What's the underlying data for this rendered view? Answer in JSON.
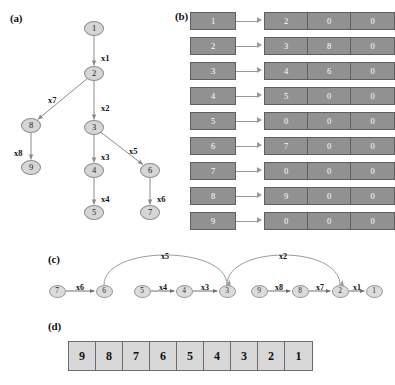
{
  "figure": {
    "panels": [
      {
        "id": "a",
        "label": "(a)"
      },
      {
        "id": "b",
        "label": "(b)"
      },
      {
        "id": "c",
        "label": "(c)"
      },
      {
        "id": "d",
        "label": "(d)"
      }
    ]
  },
  "chart_data": {
    "type": "diagram",
    "title": "",
    "panel_a": {
      "type": "tree",
      "nodes": [
        {
          "id": "1",
          "label": "1",
          "x": 94,
          "y": 28
        },
        {
          "id": "2",
          "label": "2",
          "x": 94,
          "y": 73
        },
        {
          "id": "3",
          "label": "3",
          "x": 94,
          "y": 127
        },
        {
          "id": "4",
          "label": "4",
          "x": 94,
          "y": 170
        },
        {
          "id": "5",
          "label": "5",
          "x": 94,
          "y": 212
        },
        {
          "id": "6",
          "label": "6",
          "x": 150,
          "y": 170
        },
        {
          "id": "7",
          "label": "7",
          "x": 150,
          "y": 212
        },
        {
          "id": "8",
          "label": "8",
          "x": 31,
          "y": 125
        },
        {
          "id": "9",
          "label": "9",
          "x": 31,
          "y": 167
        }
      ],
      "edges": [
        {
          "from": "1",
          "to": "2",
          "label": "x1",
          "lx": 101,
          "ly": 53
        },
        {
          "from": "2",
          "to": "3",
          "label": "x2",
          "lx": 101,
          "ly": 103
        },
        {
          "from": "2",
          "to": "8",
          "label": "x7",
          "lx": 48,
          "ly": 95
        },
        {
          "from": "3",
          "to": "4",
          "label": "x3",
          "lx": 101,
          "ly": 152
        },
        {
          "from": "3",
          "to": "6",
          "label": "x5",
          "lx": 129,
          "ly": 146
        },
        {
          "from": "4",
          "to": "5",
          "label": "x4",
          "lx": 101,
          "ly": 194
        },
        {
          "from": "6",
          "to": "7",
          "label": "x6",
          "lx": 157,
          "ly": 194
        },
        {
          "from": "8",
          "to": "9",
          "label": "x8",
          "lx": 14,
          "ly": 148
        }
      ]
    },
    "panel_b": {
      "type": "adjacency-list",
      "rows": [
        {
          "head": "1",
          "cells": [
            "2",
            "0",
            "0"
          ]
        },
        {
          "head": "2",
          "cells": [
            "3",
            "8",
            "0"
          ]
        },
        {
          "head": "3",
          "cells": [
            "4",
            "6",
            "0"
          ]
        },
        {
          "head": "4",
          "cells": [
            "5",
            "0",
            "0"
          ]
        },
        {
          "head": "5",
          "cells": [
            "0",
            "0",
            "0"
          ]
        },
        {
          "head": "6",
          "cells": [
            "7",
            "0",
            "0"
          ]
        },
        {
          "head": "7",
          "cells": [
            "0",
            "0",
            "0"
          ]
        },
        {
          "head": "8",
          "cells": [
            "9",
            "0",
            "0"
          ]
        },
        {
          "head": "9",
          "cells": [
            "0",
            "0",
            "0"
          ]
        }
      ]
    },
    "panel_c": {
      "type": "chain-graph",
      "nodes": [
        {
          "id": "7",
          "label": "7",
          "x": 57,
          "y": 291
        },
        {
          "id": "6",
          "label": "6",
          "x": 104,
          "y": 291
        },
        {
          "id": "5",
          "label": "5",
          "x": 142,
          "y": 291
        },
        {
          "id": "4",
          "label": "4",
          "x": 184,
          "y": 291
        },
        {
          "id": "3",
          "label": "3",
          "x": 227,
          "y": 291
        },
        {
          "id": "9",
          "label": "9",
          "x": 259,
          "y": 291
        },
        {
          "id": "8",
          "label": "8",
          "x": 300,
          "y": 291
        },
        {
          "id": "2",
          "label": "2",
          "x": 340,
          "y": 291
        },
        {
          "id": "1",
          "label": "1",
          "x": 374,
          "y": 291
        }
      ],
      "straight_edges": [
        {
          "from": "7",
          "to": "6",
          "label": "x6",
          "lx": 80,
          "ly": 283
        },
        {
          "from": "5",
          "to": "4",
          "label": "x4",
          "lx": 163,
          "ly": 283
        },
        {
          "from": "4",
          "to": "3",
          "label": "x3",
          "lx": 205,
          "ly": 283
        },
        {
          "from": "9",
          "to": "8",
          "label": "x8",
          "lx": 279,
          "ly": 283
        },
        {
          "from": "8",
          "to": "2",
          "label": "x7",
          "lx": 320,
          "ly": 283
        },
        {
          "from": "2",
          "to": "1",
          "label": "x1",
          "lx": 357,
          "ly": 283
        }
      ],
      "arc_edges": [
        {
          "from": "6",
          "to": "3",
          "label": "x5",
          "lx": 165,
          "ly": 252
        },
        {
          "from": "3",
          "to": "2",
          "label": "x2",
          "lx": 283,
          "ly": 252
        }
      ]
    },
    "panel_d": {
      "type": "array",
      "cells": [
        "9",
        "8",
        "7",
        "6",
        "5",
        "4",
        "3",
        "2",
        "1"
      ]
    }
  },
  "colors": {
    "node_fill": "#d6d6d6",
    "node_stroke": "#8d8d8d",
    "adj_box_fill": "#919191",
    "adj_box_text": "#ffffff",
    "array_fill": "#d8d8d8",
    "line": "#8a8a8a",
    "text": "#111111",
    "background": "#ffffff"
  }
}
